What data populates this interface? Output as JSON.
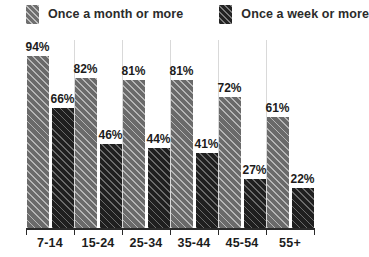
{
  "legend": {
    "items": [
      {
        "label": "Once a month or more",
        "swatch": "hatched-light-gray-swatch",
        "color": "#6a6a6a"
      },
      {
        "label": "Once a week or more",
        "swatch": "hatched-dark-swatch",
        "color": "#1f1f1f"
      }
    ]
  },
  "chart_data": {
    "type": "bar",
    "title": "",
    "xlabel": "",
    "ylabel": "",
    "ylim": [
      0,
      100
    ],
    "grid": true,
    "legend_position": "top",
    "categories": [
      "7-14",
      "15-24",
      "25-34",
      "35-44",
      "45-54",
      "55+"
    ],
    "series": [
      {
        "name": "Once a month or more",
        "color": "#6a6a6a",
        "values": [
          94,
          82,
          81,
          81,
          72,
          61
        ],
        "labels": [
          "94%",
          "82%",
          "81%",
          "81%",
          "72%",
          "61%"
        ]
      },
      {
        "name": "Once a week or more",
        "color": "#1f1f1f",
        "values": [
          66,
          46,
          44,
          41,
          27,
          22
        ],
        "labels": [
          "66%",
          "46%",
          "44%",
          "41%",
          "27%",
          "22%"
        ]
      }
    ]
  }
}
